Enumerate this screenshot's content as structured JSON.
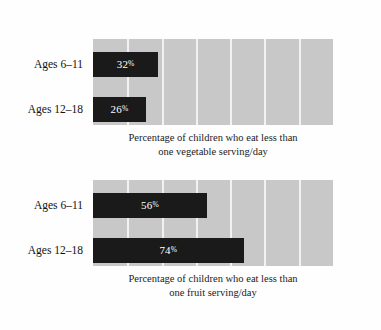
{
  "chart_data": [
    {
      "type": "bar",
      "orientation": "horizontal",
      "title": "",
      "caption_lines": [
        "Percentage of children who eat less than",
        "one vegetable serving/day"
      ],
      "caption": "Percentage of children who eat less than one vegetable serving/day",
      "categories": [
        "Ages 6–11",
        "Ages 12–18"
      ],
      "values": [
        32,
        26
      ],
      "value_labels": [
        "32",
        "26"
      ],
      "percent_suffix": "%",
      "xlabel": "",
      "ylabel": "",
      "xlim": [
        0,
        118
      ],
      "grid": true,
      "gridline_count": 6,
      "legend": "none"
    },
    {
      "type": "bar",
      "orientation": "horizontal",
      "title": "",
      "caption_lines": [
        "Percentage of children who eat less than",
        "one fruit serving/day"
      ],
      "caption": "Percentage of children who eat less than one fruit serving/day",
      "categories": [
        "Ages 6–11",
        "Ages 12–18"
      ],
      "values": [
        56,
        74
      ],
      "value_labels": [
        "56",
        "74"
      ],
      "percent_suffix": "%",
      "xlabel": "",
      "ylabel": "",
      "xlim": [
        0,
        118
      ],
      "grid": true,
      "gridline_count": 6,
      "legend": "none"
    }
  ],
  "colors": {
    "page_background": "#fefefe",
    "plot_background": "#c8c8c8",
    "bar_fill": "#1a1a1a",
    "gridline": "#f2f2f2",
    "value_text": "#ffffff",
    "label_text": "#111111"
  }
}
